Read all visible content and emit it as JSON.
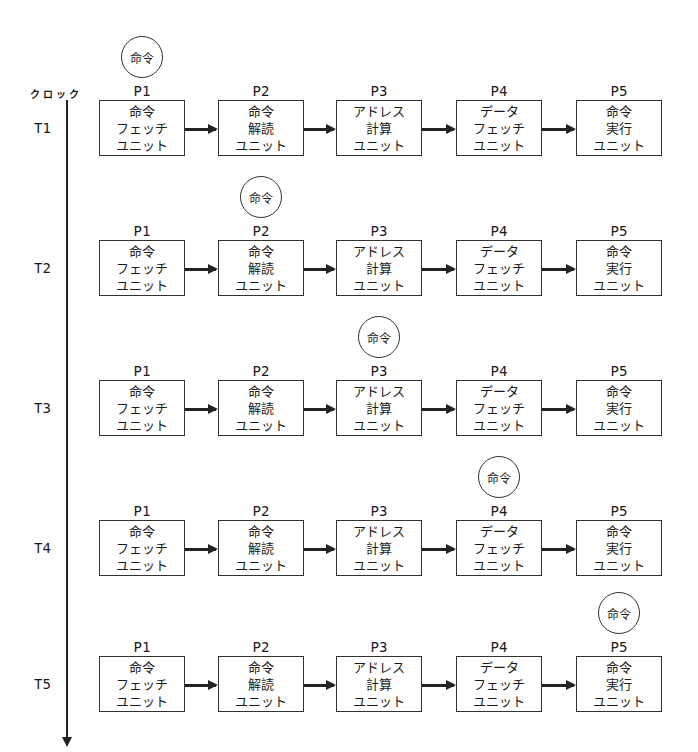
{
  "clock": {
    "label": "クロック"
  },
  "token_label": "命令",
  "stages": [
    {
      "id": "P1",
      "lines": [
        "命令",
        "フェッチ",
        "ユニット"
      ]
    },
    {
      "id": "P2",
      "lines": [
        "命令",
        "解読",
        "ユニット"
      ]
    },
    {
      "id": "P3",
      "lines": [
        "アドレス",
        "計算",
        "ユニット"
      ]
    },
    {
      "id": "P4",
      "lines": [
        "データ",
        "フェッチ",
        "ユニット"
      ]
    },
    {
      "id": "P5",
      "lines": [
        "命令",
        "実行",
        "ユニット"
      ]
    }
  ],
  "rows": [
    {
      "time": "T1",
      "active_stage": "P1"
    },
    {
      "time": "T2",
      "active_stage": "P2"
    },
    {
      "time": "T3",
      "active_stage": "P3"
    },
    {
      "time": "T4",
      "active_stage": "P4"
    },
    {
      "time": "T5",
      "active_stage": "P5"
    }
  ]
}
